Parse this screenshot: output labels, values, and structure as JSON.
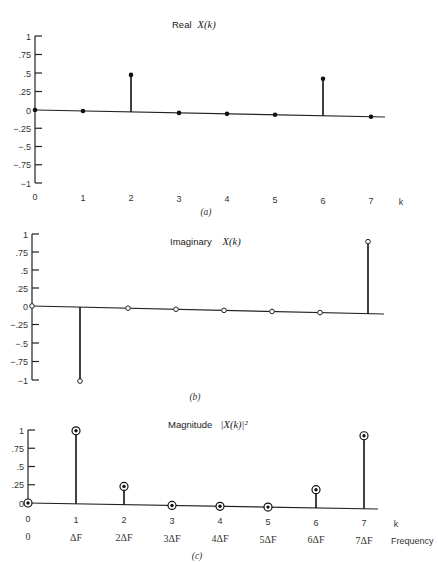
{
  "chart_data": [
    {
      "type": "stem",
      "panel": "a",
      "title": "Real",
      "title_math": "X(k)",
      "caption": "(a)",
      "xlabel": "k",
      "x": [
        0,
        1,
        2,
        3,
        4,
        5,
        6,
        7
      ],
      "values": [
        0,
        0,
        0.5,
        0,
        0,
        0,
        0.5,
        0
      ],
      "marker": "filled",
      "ylim": [
        -1,
        1
      ],
      "yticks": [
        1,
        0.75,
        0.5,
        0.25,
        0,
        -0.25,
        -0.5,
        -0.75,
        -1
      ],
      "ytick_labels": [
        "1",
        ".75",
        ".5",
        ".25",
        "0",
        "−.25",
        "−.5",
        "−.75",
        "−1"
      ],
      "xtick_labels": [
        "0",
        "1",
        "2",
        "3",
        "4",
        "5",
        "6",
        "7"
      ],
      "grid": false
    },
    {
      "type": "stem",
      "panel": "b",
      "title": "Imaginary",
      "title_math": "X(k)",
      "caption": "(b)",
      "xlabel": "",
      "x": [
        0,
        1,
        2,
        3,
        4,
        5,
        6,
        7
      ],
      "values": [
        0,
        -1,
        0,
        0,
        0,
        0,
        0,
        1
      ],
      "marker": "open",
      "ylim": [
        -1,
        1
      ],
      "yticks": [
        1,
        0.75,
        0.5,
        0.25,
        0,
        -0.25,
        -0.5,
        -0.75,
        -1
      ],
      "ytick_labels": [
        "1",
        ".75",
        ".5",
        ".25",
        "0",
        "−.25",
        "−.5",
        "−.75",
        "−1"
      ],
      "xtick_labels": [],
      "grid": false
    },
    {
      "type": "stem",
      "panel": "c",
      "title": "Magnitude",
      "title_math": "|X(k)|²",
      "caption": "(c)",
      "xlabel": "k",
      "xlabel2": "Frequency",
      "x": [
        0,
        1,
        2,
        3,
        4,
        5,
        6,
        7
      ],
      "values": [
        0,
        1,
        0.25,
        0,
        0,
        0,
        0.25,
        1
      ],
      "marker": "ringed",
      "ylim": [
        0,
        1
      ],
      "yticks": [
        1,
        0.75,
        0.5,
        0.25,
        0
      ],
      "ytick_labels": [
        "1",
        ".75",
        ".5",
        ".25",
        "0"
      ],
      "xtick_labels": [
        "0",
        "1",
        "2",
        "3",
        "4",
        "5",
        "6",
        "7"
      ],
      "freq_labels": [
        "0",
        "ΔF",
        "2ΔF",
        "3ΔF",
        "4ΔF",
        "5ΔF",
        "6ΔF",
        "7ΔF"
      ],
      "grid": false
    }
  ]
}
